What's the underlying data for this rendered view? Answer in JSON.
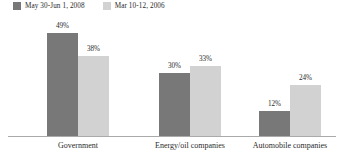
{
  "chart_data": {
    "type": "bar",
    "title": "",
    "subtitle": "",
    "xlabel": "",
    "ylabel": "",
    "ylim": [
      0,
      55
    ],
    "grid": false,
    "legend_position": "top-left",
    "categories": [
      "Government",
      "Energy/oil companies",
      "Automobile companies"
    ],
    "series": [
      {
        "name": "May 30-Jun 1, 2008",
        "color": "#787878",
        "values": [
          49,
          30,
          12
        ],
        "labels": [
          "49%",
          "30%",
          "12%"
        ]
      },
      {
        "name": "Mar 10-12, 2006",
        "color": "#d2d2d2",
        "values": [
          38,
          33,
          24
        ],
        "labels": [
          "38%",
          "33%",
          "24%"
        ]
      }
    ]
  },
  "legend": {
    "entries": [
      {
        "label": "May 30-Jun 1, 2008",
        "color": "#787878"
      },
      {
        "label": "Mar 10-12, 2006",
        "color": "#d2d2d2"
      }
    ]
  },
  "axis": {
    "baseline_color": "#aaaaaa"
  }
}
